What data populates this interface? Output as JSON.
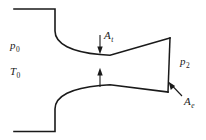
{
  "figure": {
    "name": "converging-diverging-nozzle-diagram",
    "background_color": "#ffffff",
    "line_color": "#1a1a1a"
  },
  "labels": {
    "stagnation_pressure": {
      "symbol": "p",
      "subscript": "0"
    },
    "stagnation_temperature": {
      "symbol": "T",
      "subscript": "0"
    },
    "throat_area": {
      "symbol": "A",
      "subscript": "t"
    },
    "exit_pressure": {
      "symbol": "p",
      "subscript": "2"
    },
    "exit_area": {
      "symbol": "A",
      "subscript": "e"
    }
  },
  "geometry": {
    "upper_wall_path": "M 14 9 L 55 9 L 55 31 C 55 44 72 52 100 54.5 L 110 55.2 L 170 38",
    "lower_wall_path": "M 14 131.5 L 55 131.5 L 55 109 C 55 96 72 88 100 85.5 L 110 84.8 L 168 92",
    "exit_plane_path": "M 170 38 L 168 92",
    "throat_x": 100,
    "throat_upper_y": 54.5,
    "throat_lower_y": 85.5,
    "exit_top": [
      170,
      38
    ],
    "exit_bottom": [
      168,
      92
    ],
    "upper_dim_arrow": {
      "x": 100,
      "y1": 35,
      "y2": 53
    },
    "lower_dim_arrow": {
      "x": 100,
      "y1": 87,
      "y2": 69
    },
    "exit_leader": {
      "x1": 182,
      "y1": 96,
      "x2": 169,
      "y2": 82
    }
  }
}
